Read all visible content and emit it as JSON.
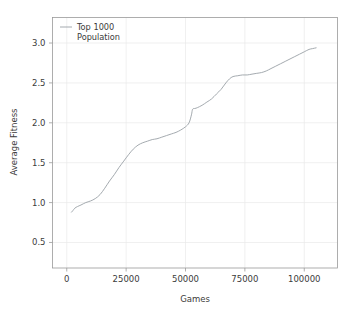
{
  "chart_data": {
    "type": "line",
    "title": "",
    "xlabel": "Games",
    "ylabel": "Average Fitness",
    "xlim": [
      -6000,
      114000
    ],
    "ylim": [
      0.18,
      3.32
    ],
    "grid": true,
    "grid_axis": "both",
    "legend_position": "upper left",
    "xticks": [
      0,
      25000,
      50000,
      75000,
      100000
    ],
    "xticklabels": [
      "0",
      "25000",
      "50000",
      "75000",
      "100000"
    ],
    "yticks": [
      0.5,
      1.0,
      1.5,
      2.0,
      2.5,
      3.0
    ],
    "yticklabels": [
      "0.5",
      "1.0",
      "1.5",
      "2.0",
      "2.5",
      "3.0"
    ],
    "series": [
      {
        "name": "Top 1000 Population",
        "color": "#9aa0a6",
        "x": [
          2000,
          2600,
          3400,
          4500,
          6000,
          8000,
          10000,
          12000,
          14000,
          16000,
          18000,
          20000,
          22000,
          24000,
          26000,
          28000,
          30000,
          32000,
          34000,
          36000,
          38000,
          40000,
          42000,
          44000,
          46000,
          48000,
          50000,
          51500,
          52500,
          53000,
          54000,
          55000,
          57000,
          59000,
          61000,
          63000,
          65000,
          67000,
          68500,
          70000,
          72000,
          74000,
          76000,
          78000,
          80000,
          82000,
          84000,
          86000,
          88000,
          90000,
          92000,
          94000,
          96000,
          98000,
          100000,
          102000,
          103500,
          105000
        ],
        "y": [
          0.88,
          0.9,
          0.93,
          0.95,
          0.97,
          1.0,
          1.02,
          1.05,
          1.1,
          1.18,
          1.27,
          1.35,
          1.44,
          1.52,
          1.6,
          1.67,
          1.72,
          1.75,
          1.77,
          1.79,
          1.8,
          1.82,
          1.84,
          1.86,
          1.88,
          1.91,
          1.95,
          2.0,
          2.1,
          2.17,
          2.18,
          2.19,
          2.22,
          2.26,
          2.3,
          2.36,
          2.42,
          2.5,
          2.55,
          2.58,
          2.59,
          2.6,
          2.6,
          2.61,
          2.62,
          2.63,
          2.65,
          2.68,
          2.71,
          2.74,
          2.77,
          2.8,
          2.83,
          2.86,
          2.89,
          2.92,
          2.93,
          2.94
        ]
      }
    ]
  },
  "legend": {
    "entries": [
      {
        "line1": "Top 1000",
        "line2": "Population"
      }
    ]
  },
  "axes": {
    "x_title": "Games",
    "y_title": "Average Fitness"
  }
}
